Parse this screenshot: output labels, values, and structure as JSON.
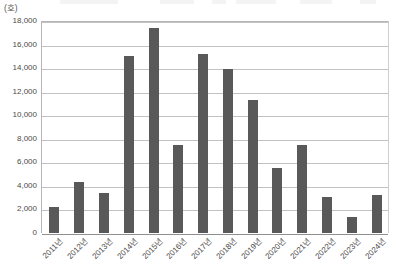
{
  "chart_data": {
    "type": "bar",
    "title": "",
    "subtitle": "",
    "xlabel": "",
    "ylabel": "",
    "unit_label": "(호)",
    "categories": [
      "2011년",
      "2012년",
      "2013년",
      "2014년",
      "2015년",
      "2016년",
      "2017년",
      "2018년",
      "2019년",
      "2020년",
      "2021년",
      "2022년",
      "2023년",
      "2024년"
    ],
    "values": [
      2200,
      4300,
      3400,
      15000,
      17400,
      7500,
      15200,
      13900,
      11300,
      5500,
      7500,
      3100,
      1400,
      3200
    ],
    "ylim": [
      0,
      18000
    ],
    "ytick_step": 2000,
    "ytick_labels": [
      "0",
      "2,000",
      "4,000",
      "6,000",
      "8,000",
      "10,000",
      "12,000",
      "14,000",
      "16,000",
      "18,000"
    ],
    "ytick_values": [
      0,
      2000,
      4000,
      6000,
      8000,
      10000,
      12000,
      14000,
      16000,
      18000
    ],
    "grid": true,
    "legend": false,
    "legend_position": "none",
    "series": [
      {
        "name": "",
        "color": "#595959",
        "values": [
          2200,
          4300,
          3400,
          15000,
          17400,
          7500,
          15200,
          13900,
          11300,
          5500,
          7500,
          3100,
          1400,
          3200
        ]
      }
    ]
  },
  "style": {
    "bar_color": "#595959",
    "grid_color": "#c2c2c2",
    "axis_color": "#8f8f8f",
    "text_color": "#4a4a4a",
    "background": "#ffffff"
  }
}
